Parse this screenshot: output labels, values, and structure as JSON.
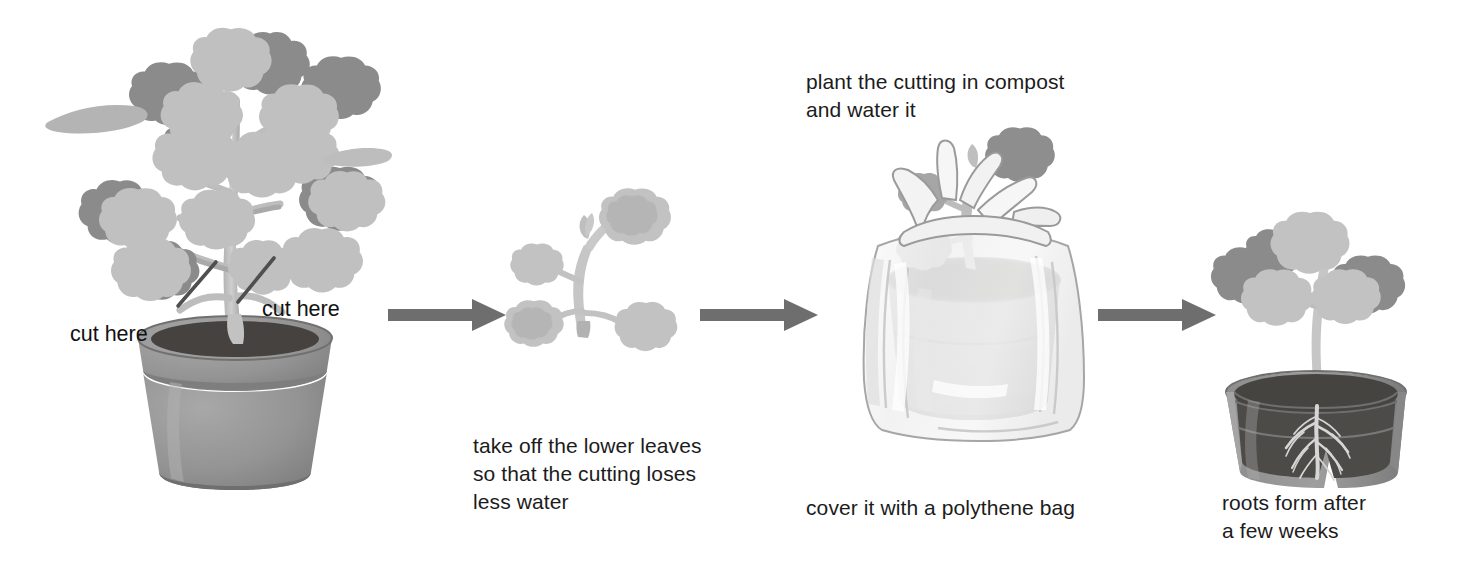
{
  "figure": {
    "background_color": "#ffffff"
  },
  "palette": {
    "arrow_gray": "#6e6e6e",
    "leaf_dark": "#8a8a8a",
    "leaf_mid": "#a3a3a3",
    "leaf_light": "#bdbdbd",
    "leaf_pale": "#cfcfcf",
    "stem_light": "#c4c4c4",
    "stem_shadow": "#aeaeae",
    "pot_body": "#8f8f8f",
    "pot_rim": "#9b9b9b",
    "pot_shadow": "#7d7d7d",
    "soil_dark": "#4e4e4e",
    "soil_darker": "#3d3d3d",
    "bag_fill": "#f4f4f4",
    "bag_line": "#9a9a9a",
    "root_light": "#d8d8d8",
    "text_color": "#1c1c1c",
    "cut_mark": "#555555"
  },
  "steps": [
    {
      "id": "step-1-parent-plant",
      "name": "parent plant in pot",
      "labels": [
        {
          "id": "cut-here-left",
          "text": "cut here"
        },
        {
          "id": "cut-here-right",
          "text": "cut here"
        }
      ],
      "caption": ""
    },
    {
      "id": "step-2-cutting",
      "name": "prepared cutting",
      "caption": "take off the lower leaves\nso that the cutting loses\nless water"
    },
    {
      "id": "step-3-potted-in-bag",
      "name": "cutting potted and bagged",
      "caption_top": "plant the cutting in compost\nand water it",
      "caption": "cover it with a polythene bag"
    },
    {
      "id": "step-4-rooted",
      "name": "rooted cutting cutaway pot",
      "caption": "roots form after\na few weeks"
    }
  ],
  "arrows": [
    {
      "id": "arrow-1",
      "label": "then"
    },
    {
      "id": "arrow-2",
      "label": "then"
    },
    {
      "id": "arrow-3",
      "label": "then"
    }
  ]
}
